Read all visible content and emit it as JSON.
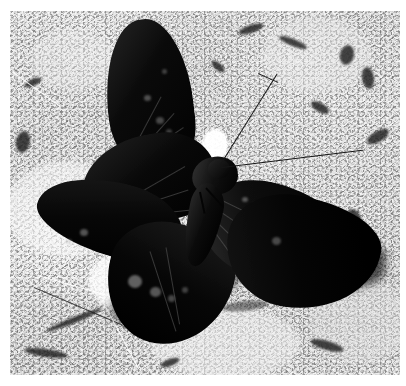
{
  "image": {
    "title": "Butterfly on rocky ground",
    "kind": "photograph",
    "tone": "black-and-white",
    "width_px": 406,
    "height_px": 386,
    "border": {
      "color": "#ffffff",
      "left_px": 10,
      "top_px": 11,
      "right_px": 6,
      "bottom_px": 11
    },
    "photo": {
      "width_px": 390,
      "height_px": 364,
      "background_description": "rough granular light-gray rock and gravel ground with dark crevices"
    }
  },
  "subject": {
    "name": "butterfly",
    "description": "large dark swallowtail butterfly with wings spread, perched on stone",
    "body_color": "#121212",
    "wing_color": "#111111",
    "sheen_color": "#5c5c5c",
    "spot_color": "#b0b0b0",
    "parts": [
      {
        "label": "upper-left-forewing"
      },
      {
        "label": "lower-left-forewing"
      },
      {
        "label": "left-hindwing-tail"
      },
      {
        "label": "right-forewing"
      },
      {
        "label": "right-hindwing"
      },
      {
        "label": "thorax"
      },
      {
        "label": "abdomen"
      },
      {
        "label": "antenna-upper"
      },
      {
        "label": "antenna-lower"
      }
    ]
  },
  "scene": {
    "background_color": "#b6b6b6",
    "highlight_color": "#f2f2f2",
    "shadow_color": "#2a2a2a",
    "elements": [
      {
        "label": "bright-white-pebble-near-head"
      },
      {
        "label": "bright-rock-patch-below-left-wing"
      },
      {
        "label": "cast-shadow-under-right-wing"
      },
      {
        "label": "thin-grass-stems-lower-left"
      },
      {
        "label": "dark-crevices-upper-right"
      }
    ]
  }
}
